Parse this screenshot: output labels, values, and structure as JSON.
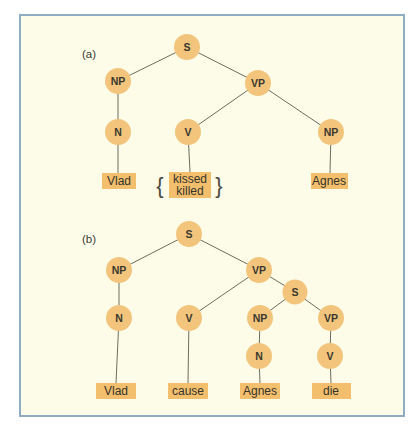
{
  "figure": {
    "colors": {
      "panel_background": "#fdfce9",
      "panel_border": "#8facc2",
      "node_fill": "#f3c57c",
      "leaf_fill": "#f3bf6c",
      "edge": "#6e6e60",
      "text": "#39382f"
    }
  },
  "tree_a": {
    "label": "(a)",
    "nodes": {
      "s": "S",
      "np_subject": "NP",
      "vp": "VP",
      "n": "N",
      "v": "V",
      "np_object": "NP"
    },
    "leaves": {
      "subject": "Vlad",
      "verb_line1": "kissed",
      "verb_line2": "killed",
      "object": "Agnes"
    },
    "brace_left": "{",
    "brace_right": "}"
  },
  "tree_b": {
    "label": "(b)",
    "nodes": {
      "s": "S",
      "np_subject": "NP",
      "vp": "VP",
      "n_subject": "N",
      "v_main": "V",
      "s_embedded": "S",
      "np_embedded": "NP",
      "vp_embedded": "VP",
      "n_embedded": "N",
      "v_embedded": "V"
    },
    "leaves": {
      "subject": "Vlad",
      "verb": "cause",
      "object": "Agnes",
      "embedded_verb": "die"
    }
  }
}
